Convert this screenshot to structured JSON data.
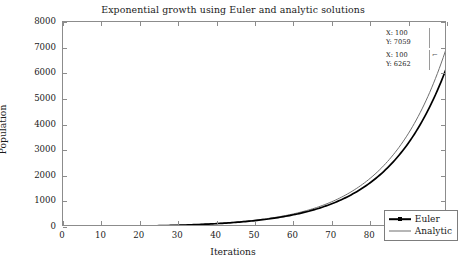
{
  "figure": {
    "background": "#ffffff",
    "axis_color": "#8c8c8c",
    "text_color": "#1a1a1a"
  },
  "chart_data": {
    "type": "line",
    "title": "Exponential growth using Euler and analytic solutions",
    "xlabel": "Iterations",
    "ylabel": "Population",
    "xlim": [
      0,
      100
    ],
    "ylim": [
      0,
      8000
    ],
    "xticks": [
      0,
      10,
      20,
      30,
      40,
      50,
      60,
      70,
      80,
      90,
      100
    ],
    "yticks": [
      0,
      1000,
      2000,
      3000,
      4000,
      5000,
      6000,
      7000,
      8000
    ],
    "grid": false,
    "legend_position": "lower right",
    "series": [
      {
        "name": "Euler",
        "color": "#000000",
        "width": 1.7,
        "marker": "square",
        "x": [
          0,
          5,
          10,
          15,
          20,
          25,
          30,
          35,
          40,
          45,
          50,
          55,
          60,
          65,
          70,
          75,
          80,
          85,
          90,
          95,
          100
        ],
        "values": [
          10,
          13,
          17,
          22,
          29,
          38,
          50,
          65,
          85,
          111,
          145,
          190,
          248,
          324,
          424,
          554,
          724,
          946,
          1236,
          1615,
          2110
        ]
      },
      {
        "name": "Analytic",
        "color": "#6f6f6f",
        "width": 1.0,
        "marker": "none",
        "x": [
          0,
          5,
          10,
          15,
          20,
          25,
          30,
          35,
          40,
          45,
          50,
          55,
          60,
          65,
          70,
          75,
          80,
          85,
          90,
          95,
          100
        ],
        "values": [
          10,
          13,
          18,
          24,
          32,
          43,
          57,
          76,
          101,
          134,
          179,
          238,
          317,
          422,
          562,
          748,
          996,
          1327,
          1767,
          2353,
          3134
        ]
      }
    ],
    "endpoints": {
      "euler_final": 6262,
      "analytic_final": 7059
    },
    "annotations": [
      {
        "id": "datatip-analytic",
        "x_label": "X: 100",
        "y_label": "Y: 7059"
      },
      {
        "id": "datatip-euler",
        "x_label": "X: 100",
        "y_label": "Y: 6262"
      }
    ]
  },
  "legend": {
    "items": [
      {
        "label": "Euler"
      },
      {
        "label": "Analytic"
      }
    ]
  }
}
